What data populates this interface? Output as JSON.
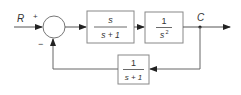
{
  "diagram": {
    "type": "feedback-control-block-diagram",
    "input_label": "R",
    "output_label": "C",
    "summing_junction": {
      "plus_sign": "+",
      "minus_sign": "−"
    },
    "forward_blocks": [
      {
        "name": "block-1",
        "numerator": "s",
        "denominator": "s + 1"
      },
      {
        "name": "block-2",
        "numerator": "1",
        "denominator": "s",
        "denominator_exp": "2"
      }
    ],
    "feedback_block": {
      "name": "feedback-block",
      "numerator": "1",
      "denominator": "s + 1"
    },
    "colors": {
      "line": "#555555",
      "box_border": "#888888",
      "text": "#333333"
    }
  }
}
